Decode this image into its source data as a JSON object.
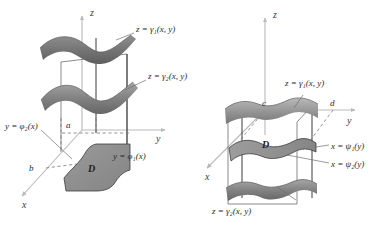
{
  "figure": {
    "background_color": "#ffffff",
    "surface_fill_dark": "#6f6f6f",
    "surface_fill_mid": "#8d8d8d",
    "surface_fill_light": "#b4b4b4",
    "region_fill": "#8a8a8a",
    "axis_color": "#b9b9b9",
    "edge_color": "#262626",
    "dash_color": "#7a7a7a",
    "label_color": "#2b2b2b"
  },
  "left_diagram": {
    "name": "type-1-solid-region",
    "axes": {
      "z_label": "z",
      "y_label": "y",
      "x_label": "x"
    },
    "tick_labels": [
      {
        "text": "a",
        "axis": "x"
      },
      {
        "text": "b",
        "axis": "x"
      }
    ],
    "surface_labels": [
      {
        "text": "z = γ₁(x, y)",
        "role": "upper-surface"
      },
      {
        "text": "z = γ₂(x, y)",
        "role": "lower-surface"
      }
    ],
    "boundary_labels": [
      {
        "text": "y = φ₂(x)",
        "role": "left-boundary"
      },
      {
        "text": "y = φ₁(x)",
        "role": "right-boundary"
      }
    ],
    "region_label": "D"
  },
  "right_diagram": {
    "name": "type-2-solid-region",
    "axes": {
      "z_label": "z",
      "y_label": "y",
      "x_label": "x"
    },
    "tick_labels": [
      {
        "text": "c",
        "axis": "y"
      },
      {
        "text": "d",
        "axis": "y"
      }
    ],
    "surface_labels": [
      {
        "text": "z = γ₁(x, y)",
        "role": "upper-surface"
      },
      {
        "text": "z = γ₂(x, y)",
        "role": "lower-surface"
      }
    ],
    "boundary_labels": [
      {
        "text": "x = ψ₁(y)",
        "role": "near-boundary"
      },
      {
        "text": "x = ψ₂(y)",
        "role": "far-boundary"
      }
    ],
    "region_label": "D"
  }
}
